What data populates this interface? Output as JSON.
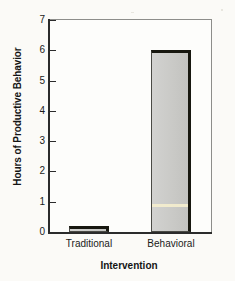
{
  "chart_data": {
    "type": "bar",
    "title": "",
    "xlabel": "Intervention",
    "ylabel": "Hours of Productive Behavior",
    "categories": [
      "Traditional",
      "Behavioral"
    ],
    "values": [
      0.2,
      6.0
    ],
    "ylim": [
      0,
      7
    ],
    "yticks": [
      0,
      1,
      2,
      3,
      4,
      5,
      6,
      7
    ],
    "ytick_labels": [
      "0",
      "1",
      "2",
      "3",
      "4",
      "5",
      "6",
      "7"
    ],
    "grid": false,
    "legend": null,
    "series": [
      {
        "name": "Hours of Productive Behavior",
        "values": [
          0.2,
          6.0
        ]
      }
    ],
    "annotations": [],
    "colors": {
      "bar_fill": "#ccccca",
      "bar_edge": "#17170f",
      "axis": "#2b2b2b",
      "frame": "#8d8d8a",
      "background": "#fbfaf7",
      "scan_artifact": "#f2ecce"
    }
  }
}
